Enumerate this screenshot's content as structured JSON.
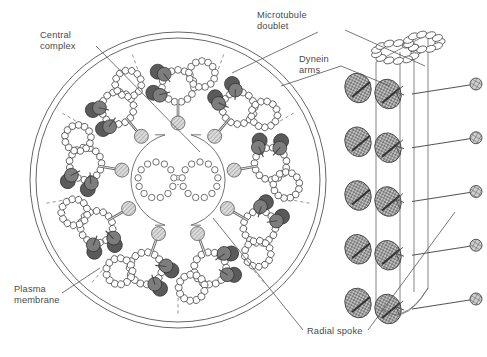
{
  "figure": {
    "background": "#ffffff",
    "width": 487,
    "height": 357
  },
  "labels": [
    {
      "id": "central-complex",
      "line1": "Central",
      "line2": "complex",
      "x": 40,
      "y": 38,
      "leader": "M 96 46 L 200 152"
    },
    {
      "id": "microtubule-doublet",
      "line1": "Microtubule",
      "line2": "doublet",
      "x": 257,
      "y": 18,
      "leader": "M 318 32 L 232 73"
    },
    {
      "id": "microtubule-doublet-3d",
      "line1": "",
      "line2": "",
      "x": 0,
      "y": 0,
      "leader": "M 345 30 L 425 66"
    },
    {
      "id": "dynein-arms",
      "line1": "Dynein",
      "line2": "arms",
      "x": 299,
      "y": 62,
      "leader": "M 341 66 L 281 86"
    },
    {
      "id": "dynein-arms-3d",
      "line1": "",
      "line2": "",
      "x": 0,
      "y": 0,
      "leader": "M 341 66 L 390 86"
    },
    {
      "id": "plasma-membrane",
      "line1": "Plasma",
      "line2": "membrane",
      "x": 14,
      "y": 292,
      "leader": "M 62 293 L 100 268"
    },
    {
      "id": "radial-spoke",
      "line1": "Radial spoke",
      "line2": "",
      "x": 307,
      "y": 334,
      "leader": "M 303 330 L 213 218"
    },
    {
      "id": "radial-spoke-3d",
      "line1": "",
      "line2": "",
      "x": 0,
      "y": 0,
      "leader": "M 368 330 L 455 212"
    }
  ],
  "cross_section": {
    "center_x": 178,
    "center_y": 180,
    "membrane_outer_r": 148,
    "membrane_inner_r": 142,
    "doublet_count": 9,
    "doublet_orbit_r": 96,
    "central_sheath_r": 47,
    "singlet_offset": 22,
    "singlet_r": 18,
    "singlet_subunits": 13,
    "tubule_r": 26,
    "subunit_count": 15,
    "subunit_r": 3.4,
    "spoke_head_r": 7,
    "dynein_blob_r": 7.5
  },
  "side_view": {
    "axis_x": 402,
    "top_y": 48,
    "bottom_y": 318,
    "levels": 5,
    "cyl_width": 52,
    "spoke_head_r": 6
  },
  "colors": {
    "outline": "#555555",
    "tubulin_fill": "#ffffff",
    "tubulin_stroke": "#444444",
    "dynein_dark": "#5a5a5a",
    "dynein_mid": "#7d7d7d",
    "spoke_head_light": "#c9c9c9",
    "stipple": "#8a8a8a",
    "text": "#4a4a4a",
    "background": "#ffffff"
  }
}
